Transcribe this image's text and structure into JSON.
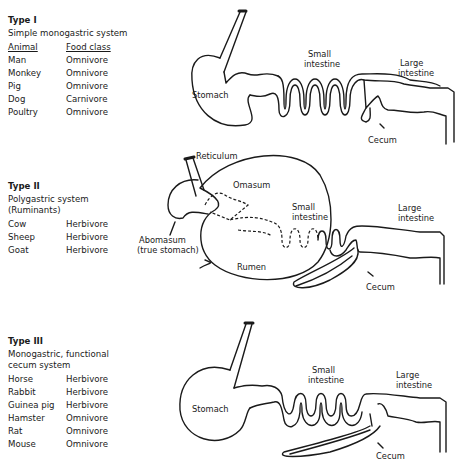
{
  "types": [
    {
      "title": "Type I",
      "description": "Simple monogastric system",
      "header": {
        "animal": "Animal",
        "food_class": "Food class"
      },
      "animals": [
        {
          "animal": "Man",
          "food_class": "Omnivore"
        },
        {
          "animal": "Monkey",
          "food_class": "Omnivore"
        },
        {
          "animal": "Pig",
          "food_class": "Omnivore"
        },
        {
          "animal": "Dog",
          "food_class": "Carnivore"
        },
        {
          "animal": "Poultry",
          "food_class": "Omnivore"
        }
      ],
      "labels": {
        "stomach": "Stomach",
        "small_1": "Small",
        "small_2": "intestine",
        "large_1": "Large",
        "large_2": "intestine",
        "cecum": "Cecum"
      }
    },
    {
      "title": "Type II",
      "description_1": "Polygastric system",
      "description_2": "(Ruminants)",
      "animals": [
        {
          "animal": "Cow",
          "food_class": "Herbivore"
        },
        {
          "animal": "Sheep",
          "food_class": "Herbivore"
        },
        {
          "animal": "Goat",
          "food_class": "Herbivore"
        }
      ],
      "labels": {
        "reticulum": "Reticulum",
        "omasum": "Omasum",
        "abomasum_1": "Abomasum",
        "abomasum_2": "(true stomach)",
        "rumen": "Rumen",
        "small_1": "Small",
        "small_2": "intestine",
        "large_1": "Large",
        "large_2": "intestine",
        "cecum": "Cecum"
      }
    },
    {
      "title": "Type III",
      "description_1": "Monogastric, functional",
      "description_2": "cecum system",
      "animals": [
        {
          "animal": "Horse",
          "food_class": "Herbivore"
        },
        {
          "animal": "Rabbit",
          "food_class": "Herbivore"
        },
        {
          "animal": "Guinea pig",
          "food_class": "Herbivore"
        },
        {
          "animal": "Hamster",
          "food_class": "Omnivore"
        },
        {
          "animal": "Rat",
          "food_class": "Omnivore"
        },
        {
          "animal": "Mouse",
          "food_class": "Omnivore"
        }
      ],
      "labels": {
        "stomach": "Stomach",
        "small_1": "Small",
        "small_2": "intestine",
        "large_1": "Large",
        "large_2": "intestine",
        "cecum": "Cecum"
      }
    }
  ]
}
